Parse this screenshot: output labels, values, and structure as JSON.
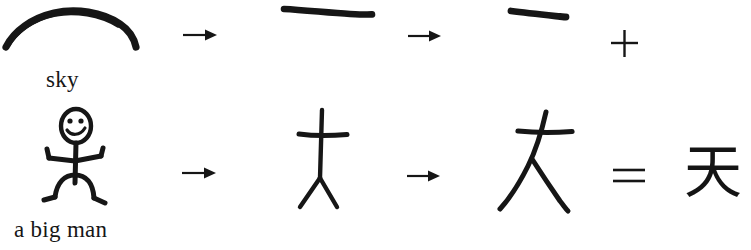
{
  "figure": {
    "background_color": "#ffffff",
    "ink_color": "#161616",
    "width": 751,
    "height": 250
  },
  "rows": [
    {
      "id": "row-sky",
      "caption": "sky",
      "steps": [
        {
          "kind": "drawing",
          "name": "arc-over-head",
          "label": "curved arc representing the sky"
        },
        {
          "kind": "operator",
          "name": "arrow-right",
          "glyph": "→"
        },
        {
          "kind": "drawing",
          "name": "horizontal-stroke-long",
          "label": "long horizontal brush stroke"
        },
        {
          "kind": "operator",
          "name": "arrow-right",
          "glyph": "→"
        },
        {
          "kind": "drawing",
          "name": "horizontal-stroke-short",
          "label": "short horizontal brush stroke, radical yi"
        },
        {
          "kind": "operator",
          "name": "plus-sign",
          "glyph": "+"
        }
      ]
    },
    {
      "id": "row-big-man",
      "caption": "a big man",
      "steps": [
        {
          "kind": "drawing",
          "name": "stick-figure-person",
          "label": "smiling stick figure with outstretched arms"
        },
        {
          "kind": "operator",
          "name": "arrow-right",
          "glyph": "→"
        },
        {
          "kind": "drawing",
          "name": "stick-figure-simplified",
          "label": "simplified stick figure, arms as one bar"
        },
        {
          "kind": "operator",
          "name": "arrow-right",
          "glyph": "→"
        },
        {
          "kind": "drawing",
          "name": "character-da-handwritten",
          "label": "handwritten character da, big"
        },
        {
          "kind": "operator",
          "name": "equals-sign",
          "glyph": "="
        },
        {
          "kind": "character",
          "name": "character-tian",
          "glyph": "天",
          "label": "tian, sky or heaven"
        }
      ]
    }
  ],
  "result": {
    "character": "天"
  }
}
